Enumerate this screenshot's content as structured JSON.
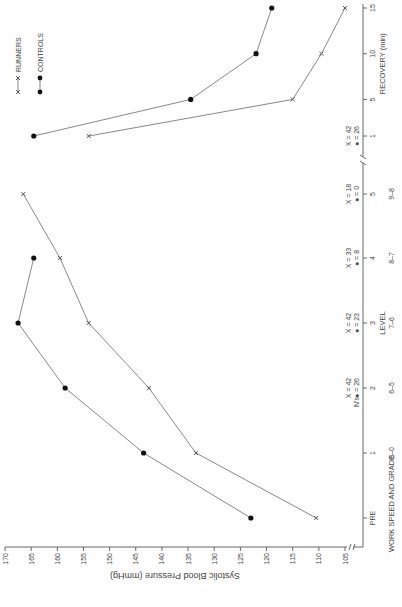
{
  "chart_data": {
    "type": "line",
    "orientation": "rotated-90-ccw",
    "title": "",
    "xlabel_primary": "WORK SPEED AND GRADE",
    "xlabel_level": "LEVEL",
    "xlabel_recovery": "RECOVERY (min)",
    "ylabel": "Systolic Blood Pressure (mmHg)",
    "ylim": [
      105,
      170
    ],
    "yticks": [
      105,
      110,
      115,
      120,
      125,
      130,
      135,
      140,
      145,
      150,
      155,
      160,
      165,
      170
    ],
    "categories": [
      "PRE",
      "1",
      "2",
      "3",
      "4",
      "5",
      "R1",
      "R5",
      "R10",
      "R15"
    ],
    "tick_labels": [
      "PRE",
      "1",
      "2",
      "3",
      "4",
      "5",
      "1",
      "5",
      "10",
      "15"
    ],
    "speed_grade_labels": [
      "",
      "6-0",
      "6-5",
      "7-6",
      "8-7",
      "9-8",
      "",
      "",
      "",
      ""
    ],
    "series": [
      {
        "name": "RUNNERS",
        "marker": "x",
        "values": [
          110.5,
          133.5,
          142.5,
          154,
          159.5,
          166.5,
          154,
          115,
          109.5,
          105
        ]
      },
      {
        "name": "CONTROLS",
        "marker": "dot",
        "values": [
          123,
          143.5,
          158.5,
          167.5,
          164.5,
          null,
          164.5,
          134.5,
          122,
          119
        ]
      }
    ],
    "n_annotations": {
      "label": "N's",
      "items": [
        {
          "category": "2",
          "runners": "X = 42",
          "controls": "● = 26"
        },
        {
          "category": "3",
          "runners": "X = 42",
          "controls": "● = 23"
        },
        {
          "category": "4",
          "runners": "X = 33",
          "controls": "● = 8"
        },
        {
          "category": "5",
          "runners": "X = 18",
          "controls": "● = 0"
        },
        {
          "category": "R1",
          "runners": "X = 42",
          "controls": "● = 26"
        }
      ]
    },
    "legend": {
      "position": "top-right",
      "items": [
        {
          "label": "X——X  RUNNERS",
          "marker": "x"
        },
        {
          "label": "●——●  CONTROLS",
          "marker": "dot"
        }
      ]
    },
    "grid": false
  }
}
